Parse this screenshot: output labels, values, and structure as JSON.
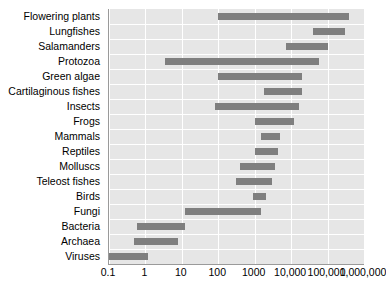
{
  "chart_data": {
    "type": "bar",
    "orientation": "horizontal",
    "subtype": "range-bar",
    "title": "",
    "subtitle": "",
    "xlabel": "",
    "ylabel": "",
    "xscale": "log",
    "xlim": [
      0.1,
      1000000
    ],
    "grid": true,
    "legend": null,
    "bar_color": "#7f7f7f",
    "plot_background": "#e6e6e6",
    "gridline_color": "#ffffff",
    "axis_color": "#9a9a9a",
    "xticks": [
      0.1,
      1,
      10,
      100,
      1000,
      10000,
      100000,
      1000000
    ],
    "xtick_labels": [
      "0.1",
      "1",
      "10",
      "100",
      "1000",
      "10,000",
      "100,000",
      "1,000,000"
    ],
    "categories": [
      "Flowering plants",
      "Lungfishes",
      "Salamanders",
      "Protozoa",
      "Green algae",
      "Cartilaginous fishes",
      "Insects",
      "Frogs",
      "Mammals",
      "Reptiles",
      "Molluscs",
      "Teleost fishes",
      "Birds",
      "Fungi",
      "Bacteria",
      "Archaea",
      "Viruses"
    ],
    "ranges": [
      {
        "category": "Flowering plants",
        "low": 100,
        "high": 400000
      },
      {
        "category": "Lungfishes",
        "low": 40000,
        "high": 300000
      },
      {
        "category": "Salamanders",
        "low": 7000,
        "high": 100000
      },
      {
        "category": "Protozoa",
        "low": 3.5,
        "high": 60000
      },
      {
        "category": "Green algae",
        "low": 100,
        "high": 20000
      },
      {
        "category": "Cartilaginous fishes",
        "low": 1800,
        "high": 20000
      },
      {
        "category": "Insects",
        "low": 80,
        "high": 16000
      },
      {
        "category": "Frogs",
        "low": 1000,
        "high": 12000
      },
      {
        "category": "Mammals",
        "low": 1500,
        "high": 5000
      },
      {
        "category": "Reptiles",
        "low": 1000,
        "high": 4500
      },
      {
        "category": "Molluscs",
        "low": 400,
        "high": 3500
      },
      {
        "category": "Teleost fishes",
        "low": 300,
        "high": 3000
      },
      {
        "category": "Birds",
        "low": 900,
        "high": 2000
      },
      {
        "category": "Fungi",
        "low": 12,
        "high": 1500
      },
      {
        "category": "Bacteria",
        "low": 0.6,
        "high": 12
      },
      {
        "category": "Archaea",
        "low": 0.5,
        "high": 8
      },
      {
        "category": "Viruses",
        "low": 0.1,
        "high": 1.2
      }
    ]
  }
}
